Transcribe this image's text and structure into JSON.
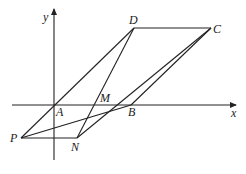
{
  "figure": {
    "axes": {
      "x_label": "x",
      "y_label": "y",
      "origin": {
        "x": 54,
        "y": 105
      },
      "x_axis": {
        "x1": 12,
        "x2": 236,
        "y": 105
      },
      "y_axis": {
        "x": 54,
        "y1": 160,
        "y2": 9
      }
    },
    "points": {
      "A": {
        "label": "A",
        "x": 54,
        "y": 105,
        "lx": 56,
        "ly": 116
      },
      "B": {
        "label": "B",
        "x": 131,
        "y": 105,
        "lx": 128,
        "ly": 116
      },
      "C": {
        "label": "C",
        "x": 211,
        "y": 28,
        "lx": 213,
        "ly": 33
      },
      "D": {
        "label": "D",
        "x": 134,
        "y": 28,
        "lx": 129,
        "ly": 24
      },
      "M": {
        "label": "M",
        "x": 108,
        "y": 104,
        "lx": 100,
        "ly": 102
      },
      "N": {
        "label": "N",
        "x": 77,
        "y": 138,
        "lx": 71,
        "ly": 151
      },
      "P": {
        "label": "P",
        "x": 21,
        "y": 138,
        "lx": 10,
        "ly": 142
      }
    },
    "segments": [
      [
        "P",
        "D"
      ],
      [
        "D",
        "C"
      ],
      [
        "D",
        "N"
      ],
      [
        "C",
        "N"
      ],
      [
        "C",
        "B"
      ],
      [
        "P",
        "B"
      ],
      [
        "P",
        "N"
      ]
    ]
  }
}
